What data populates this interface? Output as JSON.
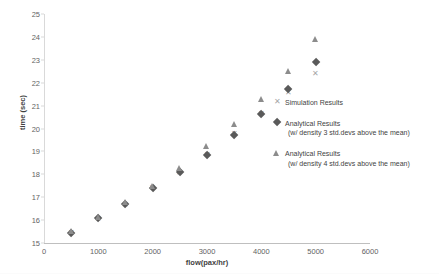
{
  "chart_data": {
    "type": "scatter",
    "title": "",
    "xlabel": "flow(pax/hr)",
    "ylabel": "time (sec)",
    "xlim": [
      0,
      6000
    ],
    "ylim": [
      15,
      25
    ],
    "xticks": [
      "0",
      "1000",
      "2000",
      "3000",
      "4000",
      "5000",
      "6000"
    ],
    "xtick_values": [
      0,
      1000,
      2000,
      3000,
      4000,
      5000,
      6000
    ],
    "yticks": [
      "15",
      "16",
      "17",
      "18",
      "19",
      "20",
      "21",
      "22",
      "23",
      "24",
      "25"
    ],
    "ytick_values": [
      15,
      16,
      17,
      18,
      19,
      20,
      21,
      22,
      23,
      24,
      25
    ],
    "grid": false,
    "legend_position": "center-right",
    "x": [
      500,
      1000,
      1500,
      2000,
      2500,
      3000,
      3500,
      4000,
      4500,
      5000
    ],
    "series": [
      {
        "name": "Simulation Results",
        "marker": "cross",
        "color": "#a6a6a6",
        "values": [
          15.45,
          16.05,
          16.65,
          17.4,
          18.05,
          18.85,
          19.75,
          20.65,
          21.55,
          22.4
        ]
      },
      {
        "name": "Analytical Results (w/ density 3 std.devs above the mean)",
        "marker": "diamond",
        "color": "#5a5a5a",
        "values": [
          15.45,
          16.1,
          16.7,
          17.4,
          18.1,
          18.85,
          19.7,
          20.65,
          21.7,
          22.9
        ]
      },
      {
        "name": "Analytical Results (w/ density 4 std.devs above the mean)",
        "marker": "triangle",
        "color": "#8c8c8c",
        "values": [
          15.5,
          16.15,
          16.8,
          17.5,
          18.25,
          19.25,
          20.2,
          21.3,
          22.5,
          23.9
        ]
      }
    ]
  },
  "legend": {
    "entries": [
      {
        "symbol": "cross-marker-icon",
        "label": "Simulation Results",
        "sublabel": ""
      },
      {
        "symbol": "diamond-marker-icon",
        "label": "Analytical Results",
        "sublabel": "(w/ density 3 std.devs above the mean)"
      },
      {
        "symbol": "triangle-marker-icon",
        "label": "Analytical Results",
        "sublabel": "(w/ density 4 std.devs above the mean)"
      }
    ]
  },
  "colors": {
    "simulation": "#a6a6a6",
    "analytical_3sd": "#5a5a5a",
    "analytical_4sd": "#8c8c8c",
    "axis": "#bfbfbf",
    "text": "#3f3f3f"
  }
}
